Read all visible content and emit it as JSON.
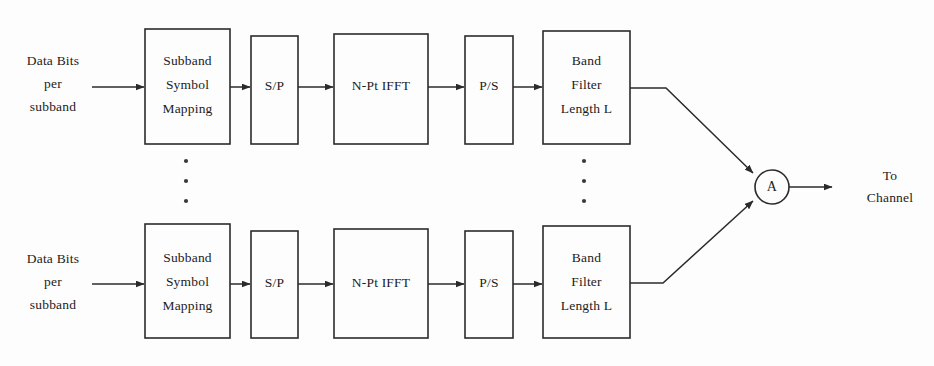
{
  "diagram": {
    "type": "block-diagram",
    "colors": {
      "background": "#fdfdfd",
      "stroke": "#2b2b2b",
      "text": "#1c1c1c"
    },
    "input_label": {
      "line1": "Data Bits",
      "line2": "per",
      "line3": "subband"
    },
    "output_label": {
      "line1": "To",
      "line2": "Channel"
    },
    "adder": {
      "symbol": "A"
    },
    "ellipsis": {
      "glyph": "·",
      "count": 3
    },
    "branches": [
      {
        "id": "top-branch",
        "blocks": [
          {
            "id": "subband-symbol-mapping",
            "lines": [
              "Subband",
              "Symbol",
              "Mapping"
            ]
          },
          {
            "id": "serial-to-parallel",
            "lines": [
              "S/P"
            ]
          },
          {
            "id": "n-pt-ifft",
            "lines": [
              "N-Pt IFFT"
            ]
          },
          {
            "id": "parallel-to-serial",
            "lines": [
              "P/S"
            ]
          },
          {
            "id": "band-filter",
            "lines": [
              "Band",
              "Filter",
              "Length L"
            ]
          }
        ]
      },
      {
        "id": "bottom-branch",
        "blocks": [
          {
            "id": "subband-symbol-mapping",
            "lines": [
              "Subband",
              "Symbol",
              "Mapping"
            ]
          },
          {
            "id": "serial-to-parallel",
            "lines": [
              "S/P"
            ]
          },
          {
            "id": "n-pt-ifft",
            "lines": [
              "N-Pt IFFT"
            ]
          },
          {
            "id": "parallel-to-serial",
            "lines": [
              "P/S"
            ]
          },
          {
            "id": "band-filter",
            "lines": [
              "Band",
              "Filter",
              "Length L"
            ]
          }
        ]
      }
    ]
  }
}
